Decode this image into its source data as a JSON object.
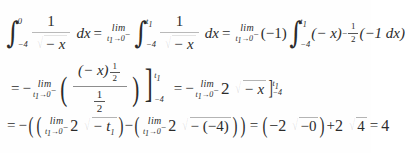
{
  "document": {
    "type": "math-derivation",
    "title": "Improper integral evaluation",
    "result": "4",
    "background_color": "#ffffff",
    "ink_color": "#2b2b2b"
  },
  "symbols": {
    "integral": "∫",
    "limit_word": "lim",
    "arrow": "→",
    "minus": "−",
    "equals": "=",
    "plus": "+",
    "radical": "√",
    "paren_open": "(",
    "paren_close": ")",
    "bracket_close": "]",
    "dx": "dx"
  },
  "line1": {
    "integral1": {
      "lower": "−4",
      "upper": "0"
    },
    "frac1": {
      "numerator": "1",
      "denominator_radicand": "− x"
    },
    "dx": "dx",
    "eq1": "=",
    "limit1": {
      "word": "lim",
      "variable": "t",
      "index": "1",
      "arrow": "→",
      "target": "0",
      "side": "−"
    },
    "integral2": {
      "lower": "−4",
      "upper": "t",
      "upper_index": "1"
    },
    "frac2": {
      "numerator": "1",
      "denominator_radicand": "− x"
    },
    "dx2": "dx",
    "eq2": "=",
    "limit2": {
      "word": "lim",
      "variable": "t",
      "index": "1",
      "arrow": "→",
      "target": "0",
      "side": "−"
    },
    "coefficient": "(−1)",
    "integral3": {
      "lower": "−4",
      "upper": "t",
      "upper_index": "1"
    },
    "base": "(− x)",
    "exponent": {
      "sign": "−",
      "numerator": "1",
      "denominator": "2"
    },
    "tail": "(−1 dx)"
  },
  "line2": {
    "eq": "=",
    "leading_minus": "−",
    "limit1": {
      "word": "lim",
      "variable": "t",
      "index": "1",
      "arrow": "→",
      "target": "0",
      "side": "−"
    },
    "frac": {
      "numerator_base": "(− x)",
      "numerator_exponent": {
        "numerator": "1",
        "denominator": "2"
      },
      "denominator": {
        "numerator": "1",
        "denominator": "2"
      }
    },
    "eval1": {
      "upper": "t",
      "upper_index": "1",
      "lower": "−4"
    },
    "eq2": "=",
    "leading_minus2": "−",
    "limit2": {
      "word": "lim",
      "variable": "t",
      "index": "1",
      "arrow": "→",
      "target": "0",
      "side": "−"
    },
    "coefficient": "2",
    "radicand": "− x",
    "eval2": {
      "upper": "t",
      "upper_index": "1",
      "lower": "−4"
    }
  },
  "line3": {
    "eq": "=",
    "leading_minus": "−",
    "term1": {
      "limit": {
        "word": "lim",
        "variable": "t",
        "index": "1",
        "arrow": "→",
        "target": "0",
        "side": "−"
      },
      "coefficient": "2",
      "radicand": "− t",
      "radicand_index": "1"
    },
    "operator": "−",
    "term2": {
      "limit": {
        "word": "lim",
        "variable": "t",
        "index": "1",
        "arrow": "→",
        "target": "0",
        "side": "−"
      },
      "coefficient": "2",
      "radicand": "− (−4)"
    },
    "eq2": "=",
    "result1": {
      "coefficient": "−2",
      "radicand": "−0"
    },
    "plus": "+",
    "result2": {
      "coefficient": "2",
      "radicand": "4"
    },
    "eq3": "=",
    "final": "4"
  }
}
